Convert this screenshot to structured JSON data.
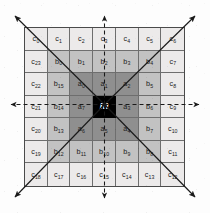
{
  "figure": {
    "type": "grid-neighborhood-diagram",
    "grid": {
      "rows": 7,
      "cols": 7
    },
    "center_label": "m",
    "colors": {
      "center": "#000000",
      "ring_a": "#8f8f8f",
      "ring_b": "#c2c2c2",
      "ring_c": "#eceaea",
      "grid_line": "#6e6e6e",
      "border": "#4a4a4a",
      "arrow": "#1a1a1a",
      "text": "#1a1a1a",
      "center_text": "#ffffff"
    },
    "rings": {
      "a": [
        "a0",
        "a1",
        "a2",
        "a3",
        "a4",
        "a5",
        "a6",
        "a7"
      ],
      "b": [
        "b0",
        "b1",
        "b2",
        "b3",
        "b4",
        "b5",
        "b6",
        "b7",
        "b8",
        "b9",
        "b10",
        "b11",
        "b12",
        "b13",
        "b14",
        "b15"
      ],
      "c": [
        "c0",
        "c1",
        "c2",
        "c3",
        "c4",
        "c5",
        "c6",
        "c7",
        "c8",
        "c9",
        "c10",
        "c11",
        "c12",
        "c13",
        "c14",
        "c15",
        "c16",
        "c17",
        "c18",
        "c19",
        "c20",
        "c21",
        "c22",
        "c23"
      ]
    }
  },
  "cells": [
    [
      {
        "base": "c",
        "sub": "0",
        "ring": "c"
      },
      {
        "base": "c",
        "sub": "1",
        "ring": "c"
      },
      {
        "base": "c",
        "sub": "2",
        "ring": "c"
      },
      {
        "base": "c",
        "sub": "3",
        "ring": "c"
      },
      {
        "base": "c",
        "sub": "4",
        "ring": "c"
      },
      {
        "base": "c",
        "sub": "5",
        "ring": "c"
      },
      {
        "base": "c",
        "sub": "6",
        "ring": "c"
      }
    ],
    [
      {
        "base": "c",
        "sub": "23",
        "ring": "c"
      },
      {
        "base": "b",
        "sub": "0",
        "ring": "b"
      },
      {
        "base": "b",
        "sub": "1",
        "ring": "b"
      },
      {
        "base": "b",
        "sub": "2",
        "ring": "b"
      },
      {
        "base": "b",
        "sub": "3",
        "ring": "b"
      },
      {
        "base": "b",
        "sub": "4",
        "ring": "b"
      },
      {
        "base": "c",
        "sub": "7",
        "ring": "c"
      }
    ],
    [
      {
        "base": "c",
        "sub": "22",
        "ring": "c"
      },
      {
        "base": "b",
        "sub": "15",
        "ring": "b"
      },
      {
        "base": "a",
        "sub": "0",
        "ring": "a"
      },
      {
        "base": "a",
        "sub": "1",
        "ring": "a"
      },
      {
        "base": "a",
        "sub": "2",
        "ring": "a"
      },
      {
        "base": "b",
        "sub": "5",
        "ring": "b"
      },
      {
        "base": "c",
        "sub": "8",
        "ring": "c"
      }
    ],
    [
      {
        "base": "c",
        "sub": "21",
        "ring": "c"
      },
      {
        "base": "b",
        "sub": "14",
        "ring": "b"
      },
      {
        "base": "a",
        "sub": "7",
        "ring": "a"
      },
      {
        "base": "m",
        "sub": "",
        "ring": "m"
      },
      {
        "base": "a",
        "sub": "3",
        "ring": "a"
      },
      {
        "base": "b",
        "sub": "6",
        "ring": "b"
      },
      {
        "base": "c",
        "sub": "9",
        "ring": "c"
      }
    ],
    [
      {
        "base": "c",
        "sub": "20",
        "ring": "c"
      },
      {
        "base": "b",
        "sub": "13",
        "ring": "b"
      },
      {
        "base": "a",
        "sub": "6",
        "ring": "a"
      },
      {
        "base": "a",
        "sub": "5",
        "ring": "a"
      },
      {
        "base": "a",
        "sub": "4",
        "ring": "a"
      },
      {
        "base": "b",
        "sub": "7",
        "ring": "b"
      },
      {
        "base": "c",
        "sub": "10",
        "ring": "c"
      }
    ],
    [
      {
        "base": "c",
        "sub": "19",
        "ring": "c"
      },
      {
        "base": "b",
        "sub": "12",
        "ring": "b"
      },
      {
        "base": "b",
        "sub": "11",
        "ring": "b"
      },
      {
        "base": "b",
        "sub": "10",
        "ring": "b"
      },
      {
        "base": "b",
        "sub": "9",
        "ring": "b"
      },
      {
        "base": "b",
        "sub": "8",
        "ring": "b"
      },
      {
        "base": "c",
        "sub": "11",
        "ring": "c"
      }
    ],
    [
      {
        "base": "c",
        "sub": "18",
        "ring": "c"
      },
      {
        "base": "c",
        "sub": "17",
        "ring": "c"
      },
      {
        "base": "c",
        "sub": "16",
        "ring": "c"
      },
      {
        "base": "c",
        "sub": "15",
        "ring": "c"
      },
      {
        "base": "c",
        "sub": "14",
        "ring": "c"
      },
      {
        "base": "c",
        "sub": "13",
        "ring": "c"
      },
      {
        "base": "c",
        "sub": "12",
        "ring": "c"
      }
    ]
  ],
  "arrows": {
    "dashed": [
      {
        "name": "arrow-up",
        "x1": 104.5,
        "y1": 104.5,
        "x2": 104.5,
        "y2": 16
      },
      {
        "name": "arrow-down",
        "x1": 104.5,
        "y1": 104.5,
        "x2": 104.5,
        "y2": 198
      },
      {
        "name": "arrow-left",
        "x1": 104.5,
        "y1": 104.5,
        "x2": 11,
        "y2": 104.5
      },
      {
        "name": "arrow-right",
        "x1": 104.5,
        "y1": 104.5,
        "x2": 199,
        "y2": 104.5
      }
    ],
    "solid": [
      {
        "name": "arrow-up-left",
        "x1": 104.5,
        "y1": 104.5,
        "x2": 15,
        "y2": 16
      },
      {
        "name": "arrow-up-right",
        "x1": 104.5,
        "y1": 104.5,
        "x2": 195,
        "y2": 16
      },
      {
        "name": "arrow-down-left",
        "x1": 104.5,
        "y1": 104.5,
        "x2": 15,
        "y2": 197
      },
      {
        "name": "arrow-down-right",
        "x1": 104.5,
        "y1": 104.5,
        "x2": 195,
        "y2": 197
      }
    ]
  }
}
